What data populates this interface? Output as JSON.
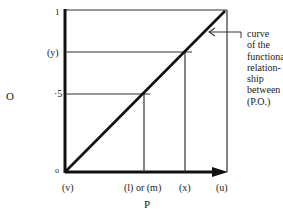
{
  "diagram": {
    "y_axis_label": "O",
    "x_axis_label": "P",
    "y_ticks": [
      {
        "label": "1",
        "value": 1.0
      },
      {
        "label": "(y)",
        "value": 0.74
      },
      {
        "label": "·5",
        "value": 0.5
      },
      {
        "label": "o",
        "value": 0.0
      }
    ],
    "x_ticks": [
      {
        "label": "(v)",
        "value": 0.0
      },
      {
        "label": "(l) or (m)",
        "value": 0.5
      },
      {
        "label": "(x)",
        "value": 0.74
      },
      {
        "label": "(u)",
        "value": 1.0
      }
    ],
    "annotation": {
      "lines": [
        "curve",
        "of the",
        "functional",
        "relation-",
        "ship",
        "between",
        "(P.O.)"
      ]
    },
    "colors": {
      "ink": "#1a1a1a",
      "background": "#ffffff"
    }
  }
}
